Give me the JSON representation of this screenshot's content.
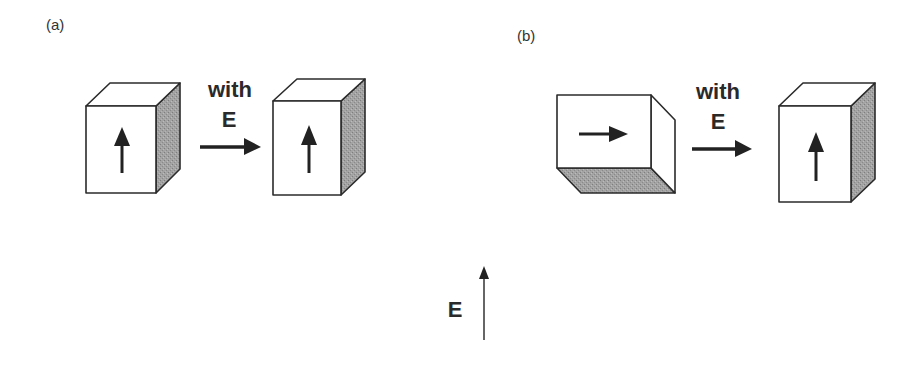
{
  "panels": {
    "a": {
      "label": "(a)",
      "transition_text_line1": "with",
      "transition_text_line2": "E",
      "before": {
        "shape": "tall-box",
        "polarization": "up-arrow",
        "shaded_face": "right"
      },
      "after": {
        "shape": "tall-box",
        "polarization": "up-arrow",
        "shaded_face": "right"
      }
    },
    "b": {
      "label": "(b)",
      "transition_text_line1": "with",
      "transition_text_line2": "E",
      "before": {
        "shape": "wide-box",
        "polarization": "right-arrow",
        "shaded_face": "bottom"
      },
      "after": {
        "shape": "tall-box",
        "polarization": "up-arrow",
        "shaded_face": "right"
      }
    }
  },
  "field_indicator": {
    "label": "E",
    "direction": "up"
  },
  "colors": {
    "stroke": "#2b2b2b",
    "shade": "#9a9a9a",
    "face": "#ffffff"
  }
}
